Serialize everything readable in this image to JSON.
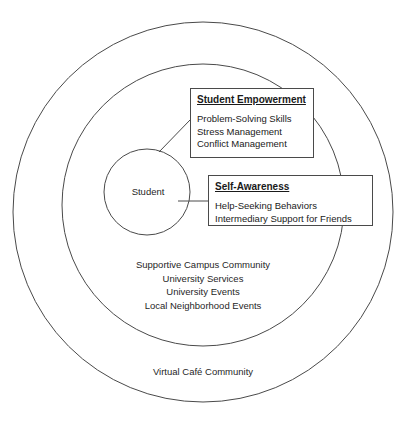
{
  "figure": {
    "type": "concentric-circles-diagram",
    "circles": [
      {
        "id": "outer",
        "label": "Virtual Café Community",
        "cx": 203,
        "cy": 212,
        "r": 190
      },
      {
        "id": "middle",
        "label": "",
        "cx": 203,
        "cy": 205,
        "r": 141
      },
      {
        "id": "inner",
        "label": "Student",
        "cx": 147,
        "cy": 192,
        "r": 43
      }
    ],
    "middle_ring_items": [
      "Supportive Campus Community",
      "University Services",
      "University Events",
      "Local Neighborhood Events"
    ],
    "callouts": [
      {
        "id": "student-empowerment",
        "title": "Student Empowerment",
        "items": [
          "Problem-Solving Skills",
          "Stress Management",
          "Conflict Management"
        ]
      },
      {
        "id": "self-awareness",
        "title": "Self-Awareness",
        "items": [
          "Help-Seeking Behaviors",
          "Intermediary Support for Friends"
        ]
      }
    ],
    "colors": {
      "stroke": "#4a4a4a",
      "background": "#ffffff",
      "text": "#1f1f1f"
    }
  },
  "artifacts": {
    "top_bleed_text": "",
    "bottom_bleed_text": ""
  }
}
